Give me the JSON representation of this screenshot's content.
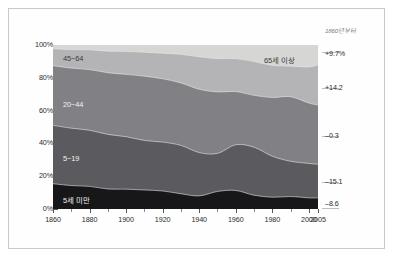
{
  "chart_data": {
    "type": "area",
    "title": "",
    "xlabel": "",
    "ylabel": "",
    "stacked": "100%",
    "grid": false,
    "legend_position": "inline-band-labels",
    "xlim": [
      1860,
      2005
    ],
    "ylim": [
      0,
      100
    ],
    "x": [
      1860,
      1870,
      1880,
      1890,
      1900,
      1910,
      1920,
      1930,
      1940,
      1950,
      1960,
      1970,
      1980,
      1990,
      2000,
      2005
    ],
    "y_ticks": [
      "0%",
      "20%",
      "40%",
      "60%",
      "80%",
      "100%"
    ],
    "y_tick_values": [
      0,
      20,
      40,
      60,
      80,
      100
    ],
    "x_ticks": [
      "1860",
      "1880",
      "1900",
      "1920",
      "1940",
      "1960",
      "1980",
      "2000",
      "2005"
    ],
    "x_tick_values": [
      1860,
      1880,
      1900,
      1920,
      1940,
      1960,
      1980,
      2000,
      2005
    ],
    "series": [
      {
        "name": "5세 미만",
        "color": "#17171a",
        "label_color": "light",
        "change_since_1860": "-8.6",
        "values": [
          15.4,
          14.3,
          13.8,
          12.2,
          12.1,
          11.6,
          11.0,
          9.3,
          8.0,
          10.7,
          11.3,
          8.4,
          7.2,
          7.6,
          6.8,
          6.8
        ]
      },
      {
        "name": "5~19",
        "color": "#5b5b5f",
        "label_color": "light",
        "change_since_1860": "-15.1",
        "values": [
          35.6,
          35.0,
          34.2,
          33.3,
          32.0,
          30.2,
          29.8,
          29.5,
          26.4,
          23.2,
          27.9,
          29.3,
          25.0,
          21.5,
          21.0,
          20.5
        ]
      },
      {
        "name": "20~44",
        "color": "#808085",
        "label_color": "light",
        "change_since_1860": "-0.3",
        "values": [
          36.4,
          36.6,
          37.0,
          37.6,
          38.0,
          39.2,
          38.6,
          38.1,
          38.6,
          37.5,
          32.4,
          31.6,
          35.8,
          39.4,
          36.8,
          36.1
        ]
      },
      {
        "name": "45~64",
        "color": "#b4b4b6",
        "label_color": "dark",
        "change_since_1860": "+14.2",
        "values": [
          10.3,
          11.3,
          12.1,
          13.1,
          14.0,
          14.6,
          15.6,
          17.4,
          19.8,
          20.3,
          20.1,
          20.6,
          19.6,
          18.6,
          22.0,
          24.5
        ]
      },
      {
        "name": "65세 이상",
        "color": "#d6d6d4",
        "label_color": "dark",
        "change_since_1860": "+9.7%",
        "values": [
          2.3,
          2.8,
          2.9,
          3.8,
          3.9,
          4.4,
          5.0,
          5.7,
          7.2,
          8.3,
          8.3,
          10.1,
          12.4,
          12.9,
          13.4,
          12.1
        ]
      }
    ]
  },
  "axes": {
    "y_labels": [
      "100%",
      "80%",
      "60%",
      "40%",
      "20%",
      "0%"
    ],
    "x_labels": [
      "1860",
      "1880",
      "1900",
      "1920",
      "1940",
      "1960",
      "1980",
      "2000",
      "2005"
    ]
  },
  "right_column": {
    "header": "1860년부터",
    "rows": [
      {
        "value": "+9.7%",
        "series": "65세 이상"
      },
      {
        "value": "+14.2",
        "series": "45~64"
      },
      {
        "value": "–0.3",
        "series": "20~44"
      },
      {
        "value": "–15.1",
        "series": "5~19"
      },
      {
        "value": "–8.6",
        "series": "5세 미만"
      }
    ]
  },
  "band_labels": {
    "over65": "65세 이상",
    "a45_64": "45~64",
    "a20_44": "20~44",
    "a5_19": "5~19",
    "under5": "5세 미만"
  },
  "colors": {
    "under5": "#17171a",
    "a5_19": "#5b5b5f",
    "a20_44": "#808085",
    "a45_64": "#b4b4b6",
    "over65": "#d6d6d4",
    "axis": "#555555",
    "text": "#2b2b2b",
    "muted": "#7a7a7a",
    "frame": "#c9c9c9"
  }
}
